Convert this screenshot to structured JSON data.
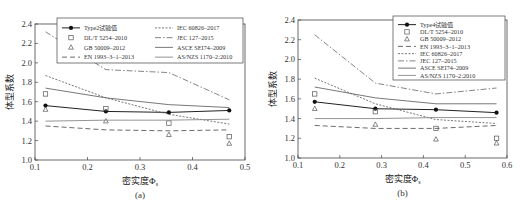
{
  "chart_data": [
    {
      "id": "a",
      "type": "line",
      "caption": "(a)",
      "xlabel": "密实度Φs",
      "ylabel": "体型系数",
      "xlim": [
        0.1,
        0.5
      ],
      "ylim": [
        1.0,
        2.4
      ],
      "xticks": [
        0.1,
        0.2,
        0.3,
        0.4,
        0.5
      ],
      "yticks": [
        1.0,
        1.2,
        1.4,
        1.6,
        1.8,
        2.0,
        2.2,
        2.4
      ],
      "x": [
        0.12,
        0.235,
        0.355,
        0.47
      ],
      "legend_position": "upper",
      "legend_columns": 2,
      "series": [
        {
          "name": "Type2试验值",
          "style": "solid-marker-dot",
          "values": [
            1.56,
            1.5,
            1.49,
            1.51
          ]
        },
        {
          "name": "DL/T 5254–2010",
          "style": "marker-square",
          "values": [
            1.68,
            1.53,
            1.38,
            1.24
          ]
        },
        {
          "name": "GB 50009–2012",
          "style": "marker-triangle",
          "values": [
            1.52,
            1.4,
            1.26,
            1.17
          ]
        },
        {
          "name": "EN 1993–3–1–2013",
          "style": "dashed",
          "values": [
            1.35,
            1.31,
            1.3,
            1.31
          ]
        },
        {
          "name": "IEC 60826–2017",
          "style": "dotted",
          "values": [
            1.87,
            1.64,
            1.47,
            1.37
          ]
        },
        {
          "name": "JEC 127–2015",
          "style": "dash-dot",
          "values": [
            2.32,
            1.93,
            1.9,
            1.62
          ]
        },
        {
          "name": "ASCE SEI74–2009",
          "style": "solid-thin",
          "values": [
            1.74,
            1.64,
            1.57,
            1.54
          ]
        },
        {
          "name": "AS/NZS 1170–2:2010",
          "style": "solid-light",
          "values": [
            1.4,
            1.41,
            1.41,
            1.42
          ]
        }
      ]
    },
    {
      "id": "b",
      "type": "line",
      "caption": "(b)",
      "xlabel": "密实度Φs",
      "ylabel": "体型系数",
      "xlim": [
        0.1,
        0.6
      ],
      "ylim": [
        1.0,
        2.4
      ],
      "xticks": [
        0.1,
        0.2,
        0.3,
        0.4,
        0.5,
        0.6
      ],
      "yticks": [
        1.0,
        1.2,
        1.4,
        1.6,
        1.8,
        2.0,
        2.2,
        2.4
      ],
      "x": [
        0.14,
        0.285,
        0.43,
        0.575
      ],
      "legend_position": "upper right",
      "legend_columns": 1,
      "series": [
        {
          "name": "Type4试验值",
          "style": "solid-marker-dot",
          "values": [
            1.57,
            1.5,
            1.49,
            1.46
          ]
        },
        {
          "name": "DL/T 5254–2010",
          "style": "marker-square",
          "values": [
            1.65,
            1.47,
            1.3,
            1.2
          ]
        },
        {
          "name": "GB 50009–2012",
          "style": "marker-triangle",
          "values": [
            1.5,
            1.34,
            1.19,
            1.15
          ]
        },
        {
          "name": "EN 1993–3–1–2013",
          "style": "dashed",
          "values": [
            1.33,
            1.3,
            1.3,
            1.33
          ]
        },
        {
          "name": "IEC 60826–2017",
          "style": "dotted",
          "values": [
            1.81,
            1.55,
            1.39,
            1.35
          ]
        },
        {
          "name": "JEC 127–2015",
          "style": "dash-dot",
          "values": [
            2.25,
            1.76,
            1.65,
            1.71
          ]
        },
        {
          "name": "ASCE SEI74–2009",
          "style": "solid-thin",
          "values": [
            1.72,
            1.61,
            1.55,
            1.55
          ]
        },
        {
          "name": "AS/NZS 1170–2:2010",
          "style": "solid-light",
          "values": [
            1.4,
            1.4,
            1.41,
            1.41
          ]
        }
      ]
    }
  ],
  "panels": {
    "a": {
      "caption": "(a)",
      "xlabel": "密实度Φ",
      "xlabel_sub": "s",
      "ylabel": "体型系数"
    },
    "b": {
      "caption": "(b)",
      "xlabel": "密实度Φ",
      "xlabel_sub": "s",
      "ylabel": "体型系数"
    }
  }
}
